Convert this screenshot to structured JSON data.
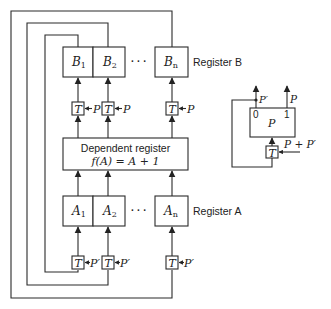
{
  "register_b": {
    "label": "Register B",
    "cells": [
      {
        "name": "B",
        "sub": "1"
      },
      {
        "name": "B",
        "sub": "2"
      },
      {
        "name": "B",
        "sub": "n"
      }
    ],
    "ellipsis": "· · ·",
    "gates": [
      {
        "gate": "T",
        "pulse": "P"
      },
      {
        "gate": "T",
        "pulse": "P"
      },
      {
        "gate": "T",
        "pulse": "P"
      }
    ]
  },
  "dependent_register": {
    "line1": "Dependent register",
    "line2": "f(A) = A + 1"
  },
  "register_a": {
    "label": "Register A",
    "cells": [
      {
        "name": "A",
        "sub": "1"
      },
      {
        "name": "A",
        "sub": "2"
      },
      {
        "name": "A",
        "sub": "n"
      }
    ],
    "ellipsis": "· · ·",
    "gates": [
      {
        "gate": "T",
        "pulse": "P′"
      },
      {
        "gate": "T",
        "pulse": "P′"
      },
      {
        "gate": "T",
        "pulse": "P′"
      }
    ]
  },
  "pulse_flipflop": {
    "name": "P",
    "output_0": "0",
    "output_1": "1",
    "output_0_label": "P′",
    "output_1_label": "P",
    "gate": "T",
    "input": "P + P′"
  }
}
